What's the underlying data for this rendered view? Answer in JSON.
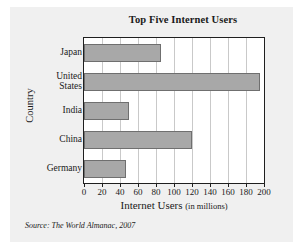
{
  "figure": {
    "source_note": "Source: The World Almanac, 2007",
    "panel_color": "#f0f0f0",
    "bar_color": "#a8a8a8",
    "bar_border_color": "#6f6f6f",
    "plot_bg": "#ffffff",
    "grid_color": "#c9c9c9",
    "axis_color": "#1f1f1f"
  },
  "chart_data": {
    "type": "bar",
    "orientation": "horizontal",
    "title": "Top Five Internet Users",
    "xlabel": "Internet Users",
    "xlabel_unit": "(in millions)",
    "ylabel": "Country",
    "categories": [
      "Japan",
      "United States",
      "India",
      "China",
      "Germany"
    ],
    "category_lines": [
      [
        "Japan"
      ],
      [
        "United",
        "States"
      ],
      [
        "India"
      ],
      [
        "China"
      ],
      [
        "Germany"
      ]
    ],
    "values": [
      86,
      196,
      50,
      120,
      47
    ],
    "xlim": [
      0,
      200
    ],
    "xticks": [
      0,
      20,
      40,
      60,
      80,
      100,
      120,
      140,
      160,
      180,
      200
    ],
    "xtick_labels": [
      "0",
      "20",
      "40",
      "60",
      "80",
      "100",
      "120",
      "140",
      "160",
      "180",
      "200"
    ],
    "grid": "vertical",
    "legend": null
  }
}
